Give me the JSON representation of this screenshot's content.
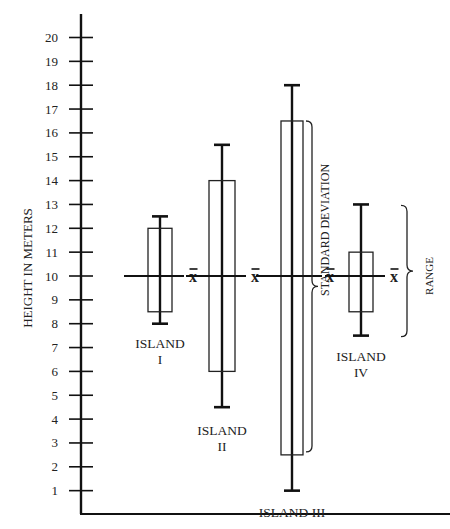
{
  "chart_data": {
    "type": "box",
    "title": "",
    "xlabel": "",
    "ylabel": "HEIGHT IN METERS",
    "ylim": [
      0,
      20.5
    ],
    "yticks": [
      1,
      2,
      3,
      4,
      5,
      6,
      7,
      8,
      9,
      10,
      11,
      12,
      13,
      14,
      15,
      16,
      17,
      18,
      19,
      20
    ],
    "grid": false,
    "categories": [
      "ISLAND I",
      "ISLAND II",
      "ISLAND III",
      "ISLAND IV"
    ],
    "series": [
      {
        "name": "ISLAND I",
        "label_lines": [
          "ISLAND",
          "I"
        ],
        "mean": 10,
        "sd_low": 8.5,
        "sd_high": 12,
        "min": 8,
        "max": 12.5
      },
      {
        "name": "ISLAND II",
        "label_lines": [
          "ISLAND",
          "II"
        ],
        "mean": 10,
        "sd_low": 6,
        "sd_high": 14,
        "min": 4.5,
        "max": 15.5
      },
      {
        "name": "ISLAND III",
        "label_lines": [
          "ISLAND III"
        ],
        "mean": 10,
        "sd_low": 2.5,
        "sd_high": 16.5,
        "min": 1,
        "max": 18
      },
      {
        "name": "ISLAND IV",
        "label_lines": [
          "ISLAND",
          "IV"
        ],
        "mean": 10,
        "sd_low": 8.5,
        "sd_high": 11,
        "min": 7.5,
        "max": 13
      }
    ],
    "mean_symbol": "X̄",
    "annotations": [
      {
        "text": "STANDARD DEVIATION",
        "applies_to": "ISLAND III",
        "type": "brace"
      },
      {
        "text": "RANGE",
        "applies_to": "ISLAND IV",
        "type": "brace"
      }
    ]
  }
}
